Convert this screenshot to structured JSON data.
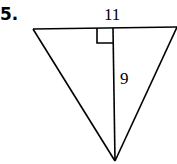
{
  "problem": {
    "number": "5.",
    "figure": "triangle",
    "labels": {
      "base": "11",
      "height": "9"
    },
    "right_angle_marker": true
  }
}
